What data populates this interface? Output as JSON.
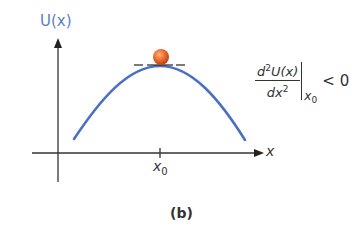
{
  "figure": {
    "caption": "(b)",
    "y_axis_label": "U(x)",
    "x_axis_label": "x",
    "tick_label": {
      "main": "x",
      "subscript": "0"
    },
    "formula": {
      "numerator_prefix": "d",
      "numerator_sup": "2",
      "numerator_body": "U(x)",
      "denominator_body": "dx",
      "denominator_sup": "2",
      "evaluated_at_main": "x",
      "evaluated_at_sub": "0",
      "relation": "< 0"
    },
    "colors": {
      "curve": "#4a6fc4",
      "ball": "#e8632a",
      "axis": "#333333",
      "y_label": "#5a7fbf"
    }
  }
}
